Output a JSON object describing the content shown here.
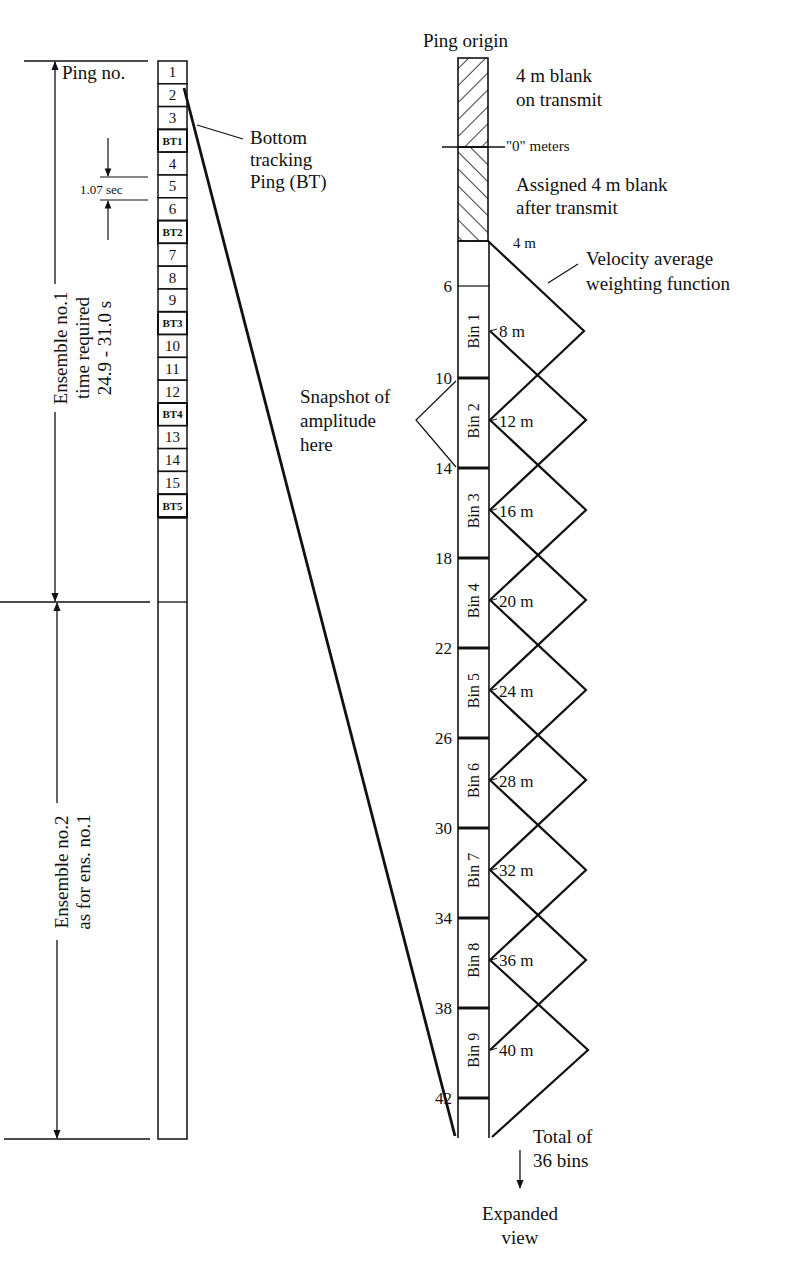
{
  "left_panel": {
    "ping_header": "Ping no.",
    "pings": [
      "1",
      "2",
      "3",
      "BT1",
      "4",
      "5",
      "6",
      "BT2",
      "7",
      "8",
      "9",
      "BT3",
      "10",
      "11",
      "12",
      "BT4",
      "13",
      "14",
      "15",
      "BT5"
    ],
    "ping_interval": "1.07 sec",
    "bottom_tracking_label": [
      "Bottom",
      "tracking",
      "Ping (BT)"
    ],
    "ensemble1_label": [
      "Ensemble no.1",
      "time required",
      "24.9 - 31.0 s"
    ],
    "ensemble2_label": [
      "Ensemble no.2",
      "as for ens. no.1"
    ]
  },
  "right_panel": {
    "title": "Ping origin",
    "blank_transmit": [
      "4 m blank",
      "on transmit"
    ],
    "zero_label": "\"0\" meters",
    "assigned_blank": [
      "Assigned 4 m blank",
      "after transmit"
    ],
    "four_m": "4 m",
    "weighting_label": [
      "Velocity average",
      "weighting function"
    ],
    "snapshot_label": [
      "Snapshot of",
      "amplitude",
      "here"
    ],
    "depth_ticks": [
      "6",
      "10",
      "14",
      "18",
      "22",
      "26",
      "30",
      "34",
      "38",
      "42"
    ],
    "bins": [
      {
        "name": "Bin 1",
        "center": "8 m"
      },
      {
        "name": "Bin 2",
        "center": "12 m"
      },
      {
        "name": "Bin 3",
        "center": "16 m"
      },
      {
        "name": "Bin 4",
        "center": "20 m"
      },
      {
        "name": "Bin 5",
        "center": "24 m"
      },
      {
        "name": "Bin 6",
        "center": "28 m"
      },
      {
        "name": "Bin 7",
        "center": "32 m"
      },
      {
        "name": "Bin 8",
        "center": "36 m"
      },
      {
        "name": "Bin 9",
        "center": "40 m"
      }
    ],
    "total_label": [
      "Total of",
      "36 bins"
    ],
    "expanded_label": [
      "Expanded",
      "view"
    ]
  }
}
